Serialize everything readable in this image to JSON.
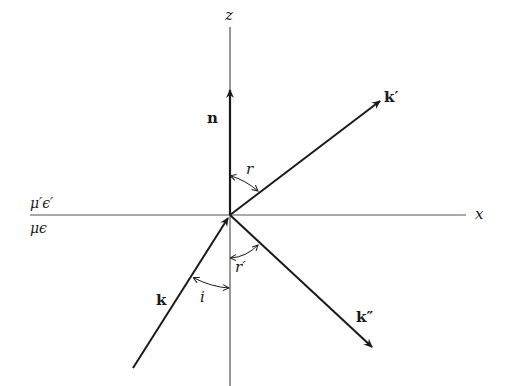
{
  "diagram": {
    "axes": {
      "z_label": "z",
      "x_label": "x"
    },
    "media": {
      "upper": "μ′ϵ′",
      "lower": "μϵ"
    },
    "vectors": {
      "normal": "n",
      "incident": "k",
      "refracted": "k′",
      "reflected": "k″"
    },
    "angles": {
      "incidence": "i",
      "refraction": "r",
      "reflection": "r′"
    },
    "colors": {
      "line": "#1a1a1a",
      "axis": "#555555",
      "background": "#ffffff"
    }
  }
}
